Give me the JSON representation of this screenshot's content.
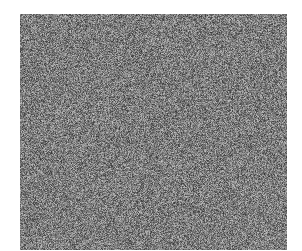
{
  "image": {
    "description": "Rectangular field of grayscale random noise (static) on a white background",
    "background_color": "#ffffff",
    "noise_panel": {
      "x": 20,
      "y": 14,
      "width": 267,
      "height": 236,
      "min_gray": 40,
      "max_gray": 215,
      "mean_gray": 110,
      "seed": 1337
    }
  }
}
